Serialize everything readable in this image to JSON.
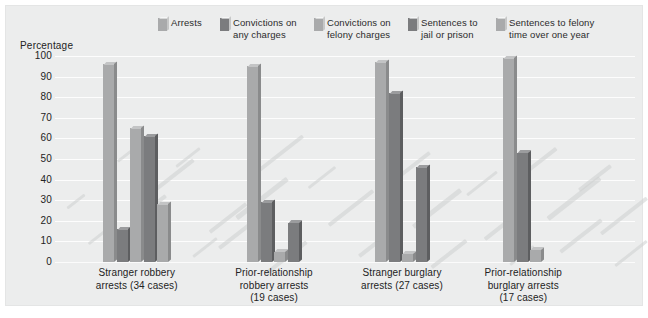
{
  "figure": {
    "background": "#eceded",
    "axis_title": "Percentage"
  },
  "legend": [
    {
      "label": "Arrests",
      "color": "#a9aaab"
    },
    {
      "label": "Convictions on\nany charges",
      "color": "#7b7c7e"
    },
    {
      "label": "Convictions on\nfelony charges",
      "color": "#a9aaab"
    },
    {
      "label": "Sentences to\njail or prison",
      "color": "#7b7c7e"
    },
    {
      "label": "Sentences to felony\ntime over one year",
      "color": "#a9aaab"
    }
  ],
  "yticks": [
    "100",
    "90",
    "80",
    "70",
    "60",
    "50",
    "40",
    "30",
    "20",
    "10",
    "0"
  ],
  "chart_data": {
    "type": "bar",
    "title": "",
    "subtitle": "",
    "xlabel": "",
    "ylabel": "Percentage",
    "ylim": [
      0,
      100
    ],
    "ytick_step": 10,
    "grid": true,
    "legend_position": "top",
    "categories": [
      "Stranger robbery\narrests (34 cases)",
      "Prior-relationship\nrobbery arrests\n(19 cases)",
      "Stranger burglary\narrests (27 cases)",
      "Prior-relationship\nburglary arrests\n(17 cases)"
    ],
    "series": [
      {
        "name": "Arrests",
        "color": "#a9aaab",
        "values": [
          96,
          95,
          97,
          99
        ]
      },
      {
        "name": "Convictions on any charges",
        "color": "#7b7c7e",
        "values": [
          16,
          29,
          82,
          53
        ]
      },
      {
        "name": "Convictions on felony charges",
        "color": "#a9aaab",
        "values": [
          65,
          5,
          4,
          6
        ]
      },
      {
        "name": "Sentences to jail or prison",
        "color": "#7b7c7e",
        "values": [
          61,
          19,
          46,
          0
        ]
      },
      {
        "name": "Sentences to felony time over one year",
        "color": "#a9aaab",
        "values": [
          28,
          0,
          0,
          0
        ]
      }
    ]
  }
}
